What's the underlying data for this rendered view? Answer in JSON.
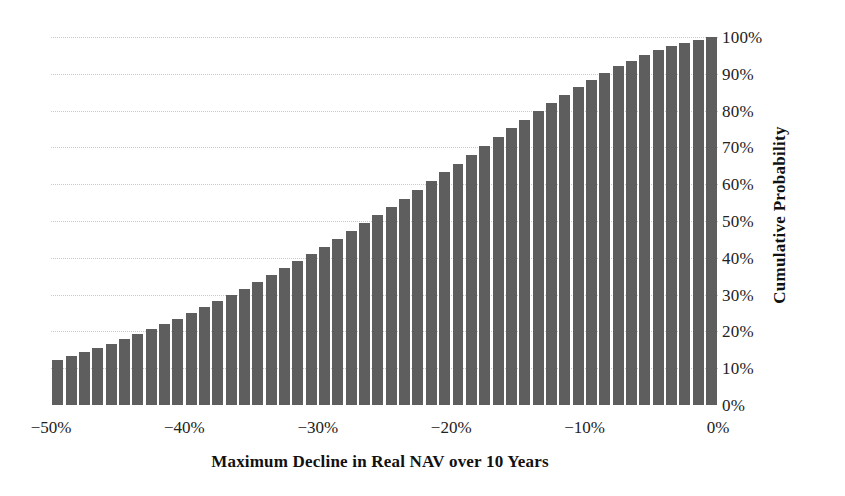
{
  "chart_data": {
    "type": "bar",
    "title": "",
    "subtitle": "",
    "xlabel": "Maximum Decline in Real NAV over 10 Years",
    "ylabel": "Cumulative Probability",
    "xlim": [
      -50,
      0
    ],
    "ylim": [
      0,
      100
    ],
    "grid": true,
    "legend": null,
    "bar_color": "#5e5e5e",
    "gridline_color": "#c9c9c9",
    "x_tick_labels": [
      "−50%",
      "−40%",
      "−30%",
      "−20%",
      "−10%",
      "0%"
    ],
    "x_tick_values": [
      -50,
      -40,
      -30,
      -20,
      -10,
      0
    ],
    "y_tick_labels": [
      "0%",
      "10%",
      "20%",
      "30%",
      "40%",
      "50%",
      "60%",
      "70%",
      "80%",
      "90%",
      "100%"
    ],
    "y_tick_values": [
      0,
      10,
      20,
      30,
      40,
      50,
      60,
      70,
      80,
      90,
      100
    ],
    "y_axis_position": "right",
    "categories": [
      "-50%",
      "-49%",
      "-48%",
      "-47%",
      "-46%",
      "-45%",
      "-44%",
      "-43%",
      "-42%",
      "-41%",
      "-40%",
      "-39%",
      "-38%",
      "-37%",
      "-36%",
      "-35%",
      "-34%",
      "-33%",
      "-32%",
      "-31%",
      "-30%",
      "-29%",
      "-28%",
      "-27%",
      "-26%",
      "-25%",
      "-24%",
      "-23%",
      "-22%",
      "-21%",
      "-20%",
      "-19%",
      "-18%",
      "-17%",
      "-16%",
      "-15%",
      "-14%",
      "-13%",
      "-12%",
      "-11%",
      "-10%",
      "-9%",
      "-8%",
      "-7%",
      "-6%",
      "-5%",
      "-4%",
      "-3%",
      "-2%",
      "-1%"
    ],
    "values": [
      12.2,
      13.2,
      14.3,
      15.4,
      16.6,
      17.9,
      19.2,
      20.6,
      22.0,
      23.5,
      25.0,
      26.6,
      28.2,
      29.9,
      31.6,
      33.4,
      35.2,
      37.1,
      39.0,
      41.0,
      43.0,
      45.1,
      47.2,
      49.4,
      51.6,
      53.8,
      56.1,
      58.4,
      60.8,
      63.2,
      65.6,
      68.0,
      70.4,
      72.8,
      75.2,
      77.5,
      79.8,
      82.0,
      84.2,
      86.3,
      88.3,
      90.2,
      92.0,
      93.6,
      95.1,
      96.4,
      97.5,
      98.4,
      99.2,
      100.0
    ]
  },
  "axes": {
    "y_title": "Cumulative Probability",
    "x_title": "Maximum Decline in Real NAV over 10 Years"
  }
}
